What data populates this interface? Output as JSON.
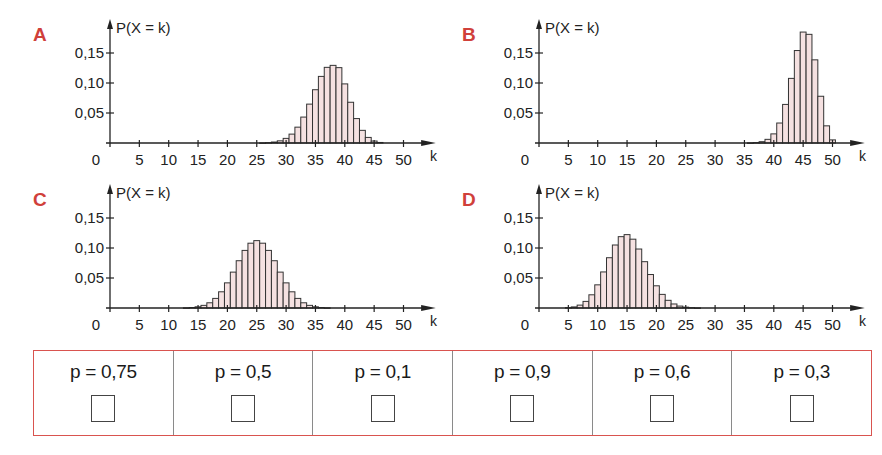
{
  "colors": {
    "label_red": "#d0403a",
    "bar_fill": "#f5e1e1",
    "bar_stroke": "#333333",
    "axis": "#222222",
    "table_border": "#d9534f",
    "divider": "#8a8a8a"
  },
  "axis_common": {
    "y_label": "P(X = k)",
    "x_label": "k",
    "y_ticks": [
      {
        "value": 0.05,
        "label": "0,05"
      },
      {
        "value": 0.1,
        "label": "0,10"
      },
      {
        "value": 0.15,
        "label": "0,15"
      }
    ],
    "x_ticks": [
      0,
      5,
      10,
      15,
      20,
      25,
      30,
      35,
      40,
      45,
      50
    ]
  },
  "chart_data": [
    {
      "id": "A",
      "type": "bar",
      "title": "A",
      "xlabel": "k",
      "ylabel": "P(X = k)",
      "xlim": [
        0,
        52
      ],
      "ylim": [
        0,
        0.18
      ],
      "x": [
        26,
        27,
        28,
        29,
        30,
        31,
        32,
        33,
        34,
        35,
        36,
        37,
        38,
        39,
        40,
        41,
        42,
        43,
        44,
        45,
        46
      ],
      "values": [
        0.0002,
        0.0006,
        0.0016,
        0.0036,
        0.0077,
        0.0148,
        0.0264,
        0.0432,
        0.0648,
        0.0888,
        0.111,
        0.1261,
        0.1294,
        0.1256,
        0.0985,
        0.0679,
        0.0407,
        0.0211,
        0.0093,
        0.0033,
        0.0009
      ]
    },
    {
      "id": "B",
      "type": "bar",
      "title": "B",
      "xlabel": "k",
      "ylabel": "P(X = k)",
      "xlim": [
        0,
        52
      ],
      "ylim": [
        0,
        0.18
      ],
      "x": [
        36,
        37,
        38,
        39,
        40,
        41,
        42,
        43,
        44,
        45,
        46,
        47,
        48,
        49,
        50
      ],
      "values": [
        0.0002,
        0.0007,
        0.0022,
        0.0061,
        0.0152,
        0.0333,
        0.0643,
        0.1077,
        0.1541,
        0.1849,
        0.1811,
        0.1386,
        0.0779,
        0.0286,
        0.0052
      ]
    },
    {
      "id": "C",
      "type": "bar",
      "title": "C",
      "xlabel": "k",
      "ylabel": "P(X = k)",
      "xlim": [
        0,
        52
      ],
      "ylim": [
        0,
        0.18
      ],
      "x": [
        13,
        14,
        15,
        16,
        17,
        18,
        19,
        20,
        21,
        22,
        23,
        24,
        25,
        26,
        27,
        28,
        29,
        30,
        31,
        32,
        33,
        34,
        35,
        36,
        37
      ],
      "values": [
        0.0003,
        0.0008,
        0.002,
        0.0044,
        0.0087,
        0.016,
        0.027,
        0.0419,
        0.0598,
        0.0788,
        0.096,
        0.108,
        0.1123,
        0.108,
        0.096,
        0.0788,
        0.0598,
        0.0419,
        0.027,
        0.016,
        0.0087,
        0.0044,
        0.002,
        0.0008,
        0.0003
      ]
    },
    {
      "id": "D",
      "type": "bar",
      "title": "D",
      "xlabel": "k",
      "ylabel": "P(X = k)",
      "xlim": [
        0,
        52
      ],
      "ylim": [
        0,
        0.18
      ],
      "x": [
        5,
        6,
        7,
        8,
        9,
        10,
        11,
        12,
        13,
        14,
        15,
        16,
        17,
        18,
        19,
        20,
        21,
        22,
        23,
        24,
        25,
        26,
        27
      ],
      "values": [
        0.0006,
        0.0018,
        0.0048,
        0.011,
        0.022,
        0.0386,
        0.0601,
        0.0838,
        0.105,
        0.1189,
        0.1223,
        0.1147,
        0.0983,
        0.0772,
        0.0558,
        0.037,
        0.0227,
        0.0128,
        0.0067,
        0.0032,
        0.0014,
        0.0006,
        0.0002
      ]
    }
  ],
  "panels": [
    {
      "letter": "A",
      "left": 0,
      "top": 0
    },
    {
      "letter": "B",
      "left": 429,
      "top": 0
    },
    {
      "letter": "C",
      "left": 0,
      "top": 165
    },
    {
      "letter": "D",
      "left": 429,
      "top": 165
    }
  ],
  "choices": [
    {
      "label": "p = 0,75"
    },
    {
      "label": "p = 0,5"
    },
    {
      "label": "p = 0,1"
    },
    {
      "label": "p = 0,9"
    },
    {
      "label": "p = 0,6"
    },
    {
      "label": "p = 0,3"
    }
  ]
}
